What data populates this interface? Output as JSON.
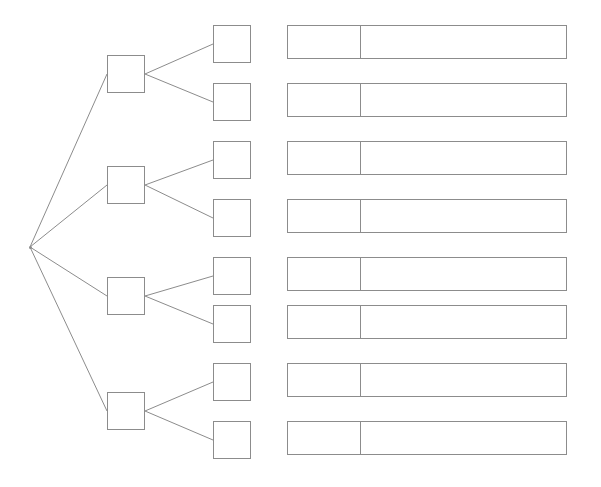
{
  "diagram": {
    "type": "tree-diagram",
    "canvas": {
      "width": 601,
      "height": 487,
      "background": "#ffffff"
    },
    "stroke_color": "#8c8c8c",
    "stroke_width": 1,
    "root": {
      "label": "",
      "shape": "vertex-point",
      "x": 30,
      "y": 247
    },
    "level1_nodes": [
      {
        "label": "",
        "x": 107,
        "y": 55,
        "w": 38,
        "h": 38
      },
      {
        "label": "",
        "x": 107,
        "y": 166,
        "w": 38,
        "h": 38
      },
      {
        "label": "",
        "x": 107,
        "y": 277,
        "w": 38,
        "h": 38
      },
      {
        "label": "",
        "x": 107,
        "y": 392,
        "w": 38,
        "h": 38
      }
    ],
    "level2_nodes": [
      {
        "label": "",
        "x": 213,
        "y": 25,
        "w": 38,
        "h": 38
      },
      {
        "label": "",
        "x": 213,
        "y": 83,
        "w": 38,
        "h": 38
      },
      {
        "label": "",
        "x": 213,
        "y": 141,
        "w": 38,
        "h": 38
      },
      {
        "label": "",
        "x": 213,
        "y": 199,
        "w": 38,
        "h": 38
      },
      {
        "label": "",
        "x": 213,
        "y": 257,
        "w": 38,
        "h": 38
      },
      {
        "label": "",
        "x": 213,
        "y": 305,
        "w": 38,
        "h": 38
      },
      {
        "label": "",
        "x": 213,
        "y": 363,
        "w": 38,
        "h": 38
      },
      {
        "label": "",
        "x": 213,
        "y": 421,
        "w": 38,
        "h": 38
      }
    ],
    "bars": [
      {
        "left_cell_label": "",
        "right_cell_label": "",
        "x": 287,
        "y": 25,
        "w": 280,
        "h": 34,
        "split_x": 73
      },
      {
        "left_cell_label": "",
        "right_cell_label": "",
        "x": 287,
        "y": 83,
        "w": 280,
        "h": 34,
        "split_x": 73
      },
      {
        "left_cell_label": "",
        "right_cell_label": "",
        "x": 287,
        "y": 141,
        "w": 280,
        "h": 34,
        "split_x": 73
      },
      {
        "left_cell_label": "",
        "right_cell_label": "",
        "x": 287,
        "y": 199,
        "w": 280,
        "h": 34,
        "split_x": 73
      },
      {
        "left_cell_label": "",
        "right_cell_label": "",
        "x": 287,
        "y": 257,
        "w": 280,
        "h": 34,
        "split_x": 73
      },
      {
        "left_cell_label": "",
        "right_cell_label": "",
        "x": 287,
        "y": 305,
        "w": 280,
        "h": 34,
        "split_x": 73
      },
      {
        "left_cell_label": "",
        "right_cell_label": "",
        "x": 287,
        "y": 363,
        "w": 280,
        "h": 34,
        "split_x": 73
      },
      {
        "left_cell_label": "",
        "right_cell_label": "",
        "x": 287,
        "y": 421,
        "w": 280,
        "h": 34,
        "split_x": 73
      }
    ],
    "edges": [
      {
        "from": "root",
        "to": "level1-1",
        "x1": 30,
        "y1": 247,
        "x2": 107,
        "y2": 74
      },
      {
        "from": "root",
        "to": "level1-2",
        "x1": 30,
        "y1": 247,
        "x2": 107,
        "y2": 185
      },
      {
        "from": "root",
        "to": "level1-3",
        "x1": 30,
        "y1": 247,
        "x2": 107,
        "y2": 296
      },
      {
        "from": "root",
        "to": "level1-4",
        "x1": 30,
        "y1": 247,
        "x2": 107,
        "y2": 411
      },
      {
        "from": "level1-1",
        "to": "level2-1",
        "x1": 145,
        "y1": 74,
        "x2": 213,
        "y2": 44
      },
      {
        "from": "level1-1",
        "to": "level2-2",
        "x1": 145,
        "y1": 74,
        "x2": 213,
        "y2": 102
      },
      {
        "from": "level1-2",
        "to": "level2-3",
        "x1": 145,
        "y1": 185,
        "x2": 213,
        "y2": 160
      },
      {
        "from": "level1-2",
        "to": "level2-4",
        "x1": 145,
        "y1": 185,
        "x2": 213,
        "y2": 218
      },
      {
        "from": "level1-3",
        "to": "level2-5",
        "x1": 145,
        "y1": 296,
        "x2": 213,
        "y2": 276
      },
      {
        "from": "level1-3",
        "to": "level2-6",
        "x1": 145,
        "y1": 296,
        "x2": 213,
        "y2": 324
      },
      {
        "from": "level1-4",
        "to": "level2-7",
        "x1": 145,
        "y1": 411,
        "x2": 213,
        "y2": 382
      },
      {
        "from": "level1-4",
        "to": "level2-8",
        "x1": 145,
        "y1": 411,
        "x2": 213,
        "y2": 440
      }
    ]
  }
}
